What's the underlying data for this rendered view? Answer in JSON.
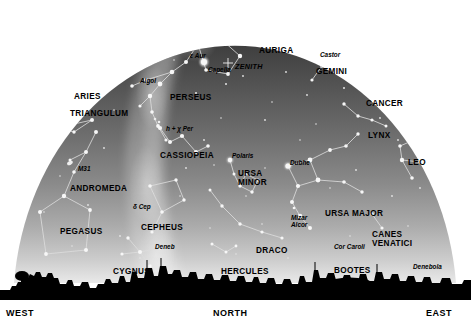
{
  "chart_data": {
    "type": "scatter",
    "projection": "hemispherical all-sky dome, horizon at bottom",
    "zenith_marker": "ZENITH",
    "grid": false,
    "legend": "none",
    "xlabel": "",
    "ylabel": "",
    "compass_directions": [
      {
        "label": "WEST",
        "x": 6,
        "y": 308
      },
      {
        "label": "NORTH",
        "x": 213,
        "y": 308
      },
      {
        "label": "EAST",
        "x": 426,
        "y": 308
      }
    ],
    "constellations": [
      {
        "name": "ARIES",
        "x": 74,
        "y": 92
      },
      {
        "name": "TRIANGULUM",
        "x": 70,
        "y": 109
      },
      {
        "name": "PERSEUS",
        "x": 170,
        "y": 93
      },
      {
        "name": "AURIGA",
        "x": 259,
        "y": 46
      },
      {
        "name": "GEMINI",
        "x": 316,
        "y": 67
      },
      {
        "name": "CANCER",
        "x": 366,
        "y": 99
      },
      {
        "name": "LYNX",
        "x": 368,
        "y": 131
      },
      {
        "name": "LEO",
        "x": 408,
        "y": 158
      },
      {
        "name": "CASSIOPEIA",
        "x": 160,
        "y": 151
      },
      {
        "name": "ANDROMEDA",
        "x": 70,
        "y": 184
      },
      {
        "name": "PEGASUS",
        "x": 60,
        "y": 227
      },
      {
        "name": "CEPHEUS",
        "x": 141,
        "y": 223
      },
      {
        "name": "URSA MINOR",
        "x": 238,
        "y": 170
      },
      {
        "name": "URSA MAJOR",
        "x": 325,
        "y": 209
      },
      {
        "name": "CANES VENATICI",
        "x": 372,
        "y": 231
      },
      {
        "name": "DRACO",
        "x": 256,
        "y": 246
      },
      {
        "name": "CYGNUS",
        "x": 113,
        "y": 267
      },
      {
        "name": "HERCULES",
        "x": 221,
        "y": 267
      },
      {
        "name": "BOOTES",
        "x": 334,
        "y": 266
      }
    ],
    "named_stars": [
      {
        "name": "ε Aur",
        "x": 190,
        "y": 52
      },
      {
        "name": "Capella",
        "x": 208,
        "y": 66
      },
      {
        "name": "Algol",
        "x": 140,
        "y": 77
      },
      {
        "name": "Castor",
        "x": 320,
        "y": 51
      },
      {
        "name": "h + χ Per",
        "x": 166,
        "y": 125
      },
      {
        "name": "M31",
        "x": 78,
        "y": 165
      },
      {
        "name": "Polaris",
        "x": 232,
        "y": 152
      },
      {
        "name": "Dubhe",
        "x": 290,
        "y": 159
      },
      {
        "name": "δ Cep",
        "x": 133,
        "y": 203
      },
      {
        "name": "Mizar",
        "x": 291,
        "y": 214
      },
      {
        "name": "Alcor",
        "x": 291,
        "y": 221
      },
      {
        "name": "Cor Caroli",
        "x": 334,
        "y": 243
      },
      {
        "name": "Deneb",
        "x": 155,
        "y": 243
      },
      {
        "name": "Denebola",
        "x": 413,
        "y": 263
      }
    ],
    "zenith_label": {
      "text": "ZENITH",
      "x": 235,
      "y": 62
    },
    "colors": {
      "sky_top": "#4a4a4a",
      "sky_horizon": "#e8e8e8",
      "star": "#f2f2f2",
      "constellation_line": "#d9d9d9",
      "milky_way": "#9d9d9d",
      "horizon_silhouette": "#000000",
      "background": "#ffffff",
      "label_text": "#000000"
    }
  }
}
